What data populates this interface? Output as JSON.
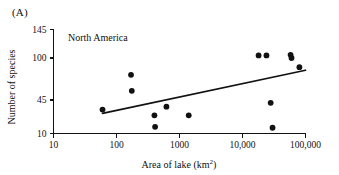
{
  "figure": {
    "panel_letter": "(A)",
    "series_label": "North America"
  },
  "chart_data": {
    "type": "scatter",
    "title": "North America",
    "xlabel": "Area of lake (km2)",
    "xlabel_base": "Area of lake (km",
    "xlabel_sup": "2",
    "xlabel_close": ")",
    "ylabel": "Number of species",
    "xscale": "log",
    "xlim": [
      10,
      100000
    ],
    "ylim": [
      10,
      145
    ],
    "grid": false,
    "legend": "none",
    "xticks": [
      10,
      100,
      1000,
      10000,
      100000
    ],
    "xticklabels": [
      "10",
      "100",
      "1000",
      "10,000",
      "100,000"
    ],
    "yticks": [
      10,
      45,
      100,
      145
    ],
    "yticklabels": [
      "10",
      "45",
      "100",
      "145"
    ],
    "point_color": "#111111",
    "line_color": "#111111",
    "points": [
      {
        "x": 60,
        "y": 35
      },
      {
        "x": 170,
        "y": 78
      },
      {
        "x": 175,
        "y": 57
      },
      {
        "x": 400,
        "y": 29
      },
      {
        "x": 410,
        "y": 17
      },
      {
        "x": 620,
        "y": 38
      },
      {
        "x": 1400,
        "y": 29
      },
      {
        "x": 18000,
        "y": 104
      },
      {
        "x": 24000,
        "y": 104
      },
      {
        "x": 28000,
        "y": 42
      },
      {
        "x": 30000,
        "y": 16
      },
      {
        "x": 58000,
        "y": 105
      },
      {
        "x": 60000,
        "y": 100
      },
      {
        "x": 80000,
        "y": 88
      }
    ],
    "trend_line": {
      "x_start": 60,
      "y_start": 31,
      "x_end": 100000,
      "y_end": 84
    },
    "annotations": [
      {
        "text": "North America",
        "x": 170,
        "y": 138
      }
    ]
  }
}
